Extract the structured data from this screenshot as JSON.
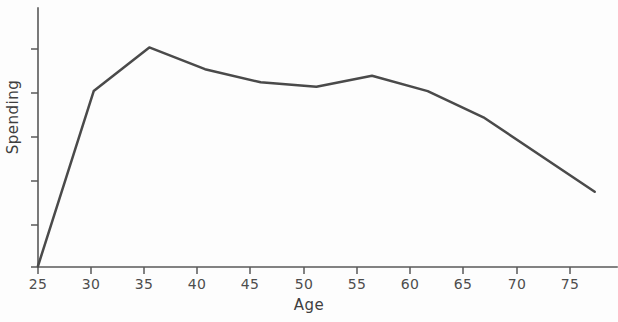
{
  "chart_data": {
    "type": "line",
    "title": "",
    "subtitle": "",
    "xlabel": "Age",
    "ylabel": "Spending",
    "x": [
      25,
      30,
      35,
      40,
      45,
      50,
      55,
      60,
      65,
      75
    ],
    "values": [
      0,
      80,
      100,
      90,
      84,
      82,
      87,
      80,
      68,
      34
    ],
    "series": [
      {
        "name": "Spending",
        "x": [
          25,
          30,
          35,
          40,
          45,
          50,
          55,
          60,
          65,
          75
        ],
        "values": [
          0,
          80,
          100,
          90,
          84,
          82,
          87,
          80,
          68,
          34
        ]
      }
    ],
    "xticks": [
      25,
      30,
      35,
      40,
      45,
      50,
      55,
      60,
      65,
      70,
      75
    ],
    "xtick_labels": [
      "25",
      "30",
      "35",
      "40",
      "45",
      "50",
      "55",
      "60",
      "65",
      "70",
      "75"
    ],
    "yticks": [],
    "ytick_labels": [],
    "xlim": [
      25,
      77
    ],
    "ylim": [
      0,
      118
    ],
    "grid": false,
    "legend": false,
    "legend_position": "none",
    "annotations": [],
    "line_color": "#4a4a4a",
    "axis_color": "#585858",
    "background_color": "#fdfdfd"
  },
  "axes": {
    "x_label": "Age",
    "y_label": "Spending",
    "y_axis_has_labels": false,
    "y_tick_count": 5
  }
}
